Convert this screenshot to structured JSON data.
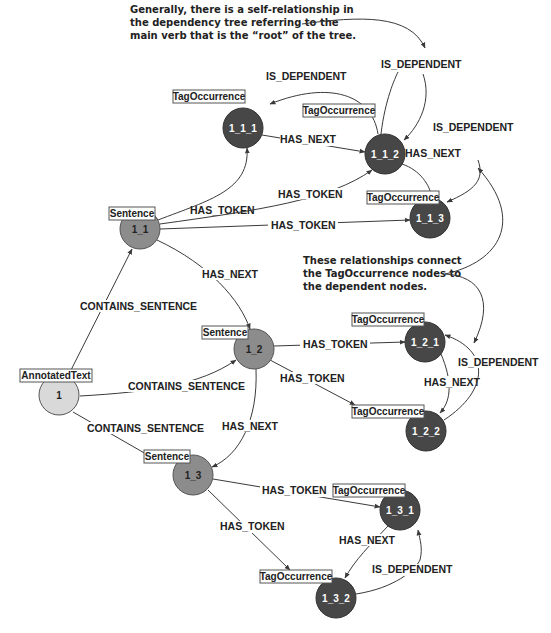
{
  "annotations": {
    "top": [
      "Generally, there is a self-relationship in",
      "the dependency tree referring to the",
      "main verb that is the “root” of the tree."
    ],
    "middle": [
      "These relationships connect",
      "the TagOccurrence nodes to",
      "the dependent nodes."
    ]
  },
  "colors": {
    "annotated_text": "#d9d9d9",
    "sentence": "#8c8c8c",
    "tag_occurrence": "#474747",
    "edge": "#3a3a3a"
  },
  "nodes": [
    {
      "id": "n1",
      "label": "1",
      "type": "AnnotatedText",
      "x": 59,
      "y": 395
    },
    {
      "id": "n1_1",
      "label": "1_1",
      "type": "Sentence",
      "x": 140,
      "y": 229
    },
    {
      "id": "n1_2",
      "label": "1_2",
      "type": "Sentence",
      "x": 254,
      "y": 349
    },
    {
      "id": "n1_3",
      "label": "1_3",
      "type": "Sentence",
      "x": 193,
      "y": 475
    },
    {
      "id": "n1_1_1",
      "label": "1_1_1",
      "type": "TagOccurrence",
      "x": 243,
      "y": 128
    },
    {
      "id": "n1_1_2",
      "label": "1_1_2",
      "type": "TagOccurrence",
      "x": 385,
      "y": 154
    },
    {
      "id": "n1_1_3",
      "label": "1_1_3",
      "type": "TagOccurrence",
      "x": 430,
      "y": 218
    },
    {
      "id": "n1_2_1",
      "label": "1_2_1",
      "type": "TagOccurrence",
      "x": 425,
      "y": 342
    },
    {
      "id": "n1_2_2",
      "label": "1_2_2",
      "type": "TagOccurrence",
      "x": 426,
      "y": 431
    },
    {
      "id": "n1_3_1",
      "label": "1_3_1",
      "type": "TagOccurrence",
      "x": 400,
      "y": 510
    },
    {
      "id": "n1_3_2",
      "label": "1_3_2",
      "type": "TagOccurrence",
      "x": 336,
      "y": 598
    }
  ],
  "tags": {
    "n1": "AnnotatedText",
    "n1_1": "Sentence",
    "n1_2": "Sentence",
    "n1_3": "Sentence",
    "n1_1_1": "TagOccurrence",
    "n1_1_2": "TagOccurrence",
    "n1_1_3": "TagOccurrence",
    "n1_2_1": "TagOccurrence",
    "n1_2_2": "TagOccurrence",
    "n1_3_1": "TagOccurrence",
    "n1_3_2": "TagOccurrence"
  },
  "labels": {
    "n1": "1",
    "n1_1": "1_1",
    "n1_2": "1_2",
    "n1_3": "1_3",
    "n1_1_1": "1_1_1",
    "n1_1_2": "1_1_2",
    "n1_1_3": "1_1_3",
    "n1_2_1": "1_2_1",
    "n1_2_2": "1_2_2",
    "n1_3_1": "1_3_1",
    "n1_3_2": "1_3_2"
  },
  "edges": {
    "e_cs1": "CONTAINS_SENTENCE",
    "e_cs2": "CONTAINS_SENTENCE",
    "e_cs3": "CONTAINS_SENTENCE",
    "e_ht_11_111": "HAS_TOKEN",
    "e_ht_11_112": "HAS_TOKEN",
    "e_ht_11_113": "HAS_TOKEN",
    "e_hn_11_12": "HAS_NEXT",
    "e_hn_12_13": "HAS_NEXT",
    "e_hn_111_112": "HAS_NEXT",
    "e_hn_112_113": "HAS_NEXT",
    "e_dep_112_111": "IS_DEPENDENT",
    "e_dep_112_self": "IS_DEPENDENT",
    "e_dep_112_113": "IS_DEPENDENT",
    "e_ht_12_121": "HAS_TOKEN",
    "e_ht_12_122": "HAS_TOKEN",
    "e_hn_121_122": "HAS_NEXT",
    "e_dep_122_121": "IS_DEPENDENT",
    "e_ht_13_131": "HAS_TOKEN",
    "e_ht_13_132": "HAS_TOKEN",
    "e_hn_131_132": "HAS_NEXT",
    "e_dep_132_131": "IS_DEPENDENT"
  }
}
